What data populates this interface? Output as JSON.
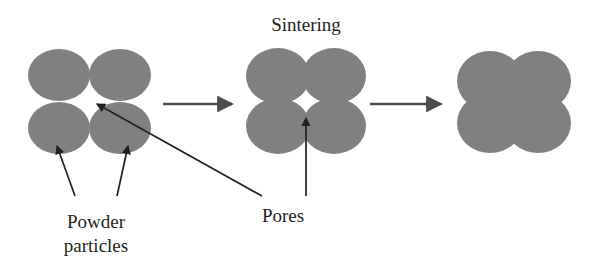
{
  "figure": {
    "title": "Sintering",
    "background_color": "#ffffff",
    "particle_color": "#808080",
    "line_color": "#231f20",
    "text_color": "#231f20"
  },
  "labels": {
    "title": "Sintering",
    "powder_particles_line1": "Powder",
    "powder_particles_line2": "particles",
    "pores": "Pores"
  },
  "stages": [
    {
      "name": "loose-powder",
      "description": "Loose powder particles in contact",
      "particle_count": 4,
      "overlap": "none",
      "pore": "large"
    },
    {
      "name": "intermediate-sintering",
      "description": "Partially sintered particles with small central pore",
      "particle_count": 4,
      "overlap": "partial",
      "pore": "small"
    },
    {
      "name": "densified",
      "description": "Fully sintered dense body",
      "particle_count": 4,
      "overlap": "high",
      "pore": "none"
    }
  ],
  "process_arrows": [
    {
      "name": "arrow-stage1-to-stage2"
    },
    {
      "name": "arrow-stage2-to-stage3"
    }
  ],
  "leader_arrows": [
    {
      "name": "leader-powder-left",
      "target": "stage1-bottom-left-particle"
    },
    {
      "name": "leader-powder-right",
      "target": "stage1-bottom-right-particle"
    },
    {
      "name": "leader-pore-stage1",
      "target": "stage1-center-pore"
    },
    {
      "name": "leader-pore-stage2",
      "target": "stage2-center-pore"
    }
  ]
}
